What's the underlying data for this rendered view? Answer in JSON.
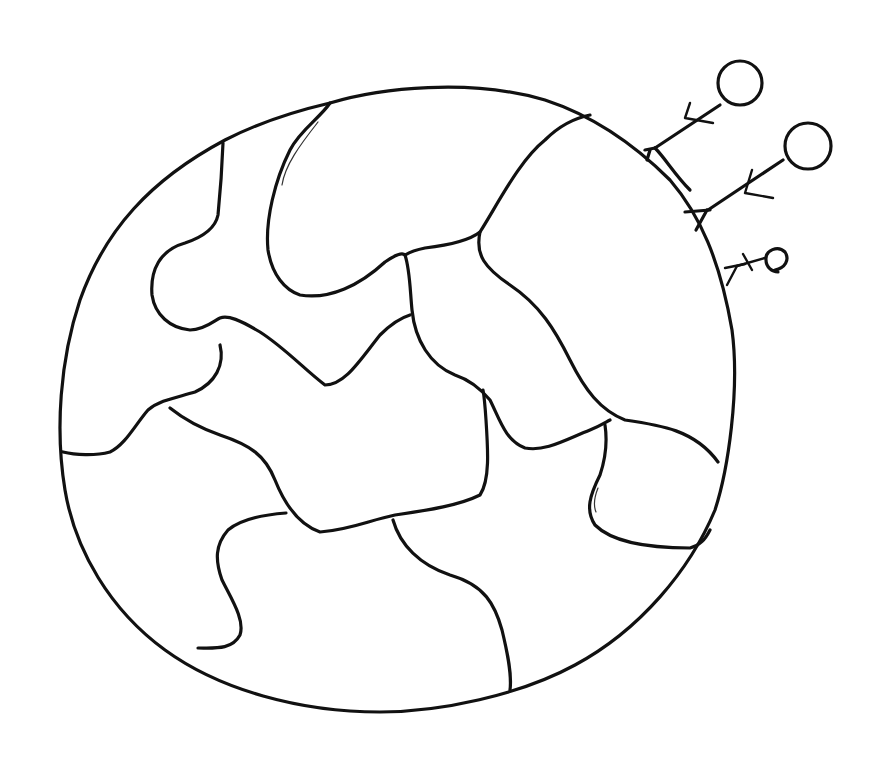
{
  "drawing": {
    "subject": "hand-drawn globe with flowers",
    "style": "black line art on white",
    "background_color": "#ffffff",
    "ink_color": "#111111",
    "globe": {
      "name": "globe-outline",
      "continent_count": 9
    },
    "flowers": [
      {
        "name": "flower-large-top",
        "petal_shape": "circle"
      },
      {
        "name": "flower-large-middle",
        "petal_shape": "circle"
      },
      {
        "name": "flower-small-bottom",
        "petal_shape": "circle"
      }
    ]
  }
}
